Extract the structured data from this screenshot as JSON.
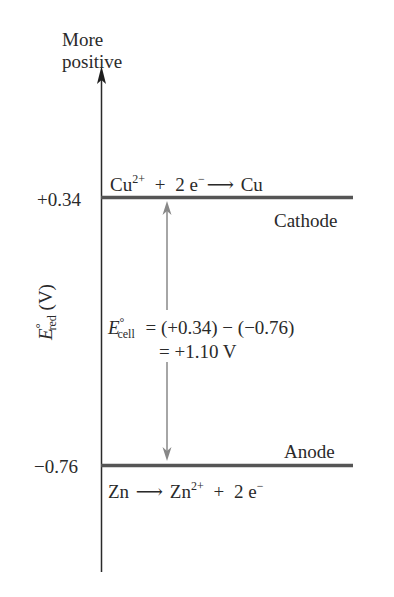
{
  "diagram": {
    "type": "energy-level",
    "axis": {
      "top_label_line1": "More",
      "top_label_line2": "positive",
      "ylabel_main": "E",
      "ylabel_sup": "°",
      "ylabel_sub": "red",
      "ylabel_unit": "(V)"
    },
    "levels": [
      {
        "value_label": "+0.34",
        "value": 0.34,
        "role": "Cathode",
        "reaction": {
          "reactant": "Cu",
          "reactant_charge": "2+",
          "plus": "+",
          "electrons": "2 e",
          "electron_charge": "−",
          "arrow": "⟶",
          "product": "Cu"
        }
      },
      {
        "value_label": "−0.76",
        "value": -0.76,
        "role": "Anode",
        "reaction": {
          "reactant": "Zn",
          "arrow": "⟶",
          "product": "Zn",
          "product_charge": "2+",
          "plus": "+",
          "electrons": "2 e",
          "electron_charge": "−"
        }
      }
    ],
    "equation": {
      "symbol": "E",
      "symbol_sup": "°",
      "symbol_sub": "cell",
      "line1": "= (+0.34) − (−0.76)",
      "line2": "= +1.10 V"
    },
    "colors": {
      "axis": "#222222",
      "level_line": "#555555",
      "arrow": "#888888"
    }
  }
}
